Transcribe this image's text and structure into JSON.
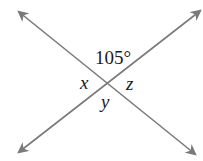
{
  "diagram": {
    "type": "intersecting-lines-angles",
    "line_color": "#7a7a7a",
    "labels": {
      "top": "105°",
      "left": "x",
      "right": "z",
      "bottom": "y"
    }
  }
}
